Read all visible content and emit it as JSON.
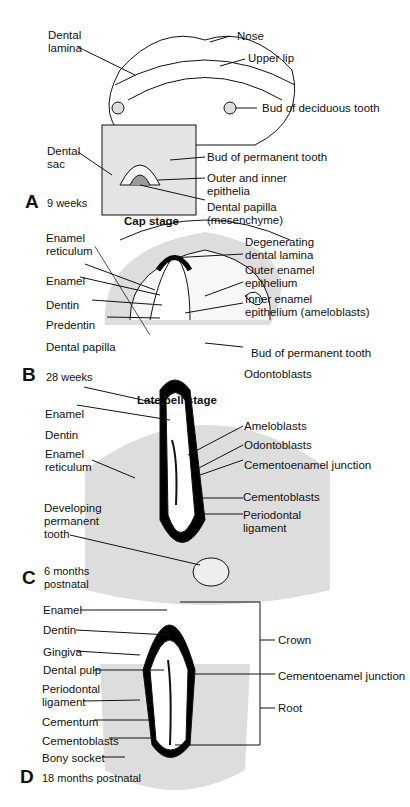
{
  "figure": {
    "panels": [
      {
        "id": "A",
        "letter": "A",
        "age": "9 weeks",
        "stage": "Cap stage",
        "labels": {
          "dental_lamina": "Dental\nlamina",
          "nose": "Nose",
          "upper_lip": "Upper lip",
          "bud_deciduous": "Bud of deciduous tooth",
          "dental_sac": "Dental\nsac",
          "bud_permanent": "Bud of permanent tooth",
          "outer_inner_epithelia": "Outer and inner\nepithelia",
          "dental_papilla": "Dental papilla\n(mesenchyme)"
        }
      },
      {
        "id": "B",
        "letter": "B",
        "age": "28 weeks",
        "stage": "Late bell stage",
        "labels": {
          "enamel_reticulum": "Enamel\nreticulum",
          "enamel": "Enamel",
          "dentin": "Dentin",
          "predentin": "Predentin",
          "dental_papilla": "Dental papilla",
          "degenerating_lamina": "Degenerating\ndental lamina",
          "outer_enamel_epithelium": "Outer enamel\nepithelium",
          "inner_enamel_epithelium": "Inner enamel\nepithelium (ameloblasts)",
          "bud_permanent": "Bud of permanent tooth",
          "odontoblasts": "Odontoblasts"
        }
      },
      {
        "id": "C",
        "letter": "C",
        "age": "6 months\npostnatal",
        "labels": {
          "enamel": "Enamel",
          "dentin": "Dentin",
          "enamel_reticulum": "Enamel\nreticulum",
          "developing_permanent": "Developing\npermanent\ntooth",
          "ameloblasts": "Ameloblasts",
          "odontoblasts": "Odontoblasts",
          "cementoenamel_junction": "Cementoenamel junction",
          "cementoblasts": "Cementoblasts",
          "periodontal_ligament": "Periodontal\nligament"
        }
      },
      {
        "id": "D",
        "letter": "D",
        "age": "18 months postnatal",
        "labels": {
          "enamel": "Enamel",
          "dentin": "Dentin",
          "gingiva": "Gingiva",
          "dental_pulp": "Dental pulp",
          "periodontal_ligament": "Periodontal\nligament",
          "cementum": "Cementum",
          "cementoblasts": "Cementoblasts",
          "bony_socket": "Bony socket",
          "crown": "Crown",
          "cementoenamel_junction": "Cementoenamel junction",
          "root": "Root"
        }
      }
    ]
  }
}
